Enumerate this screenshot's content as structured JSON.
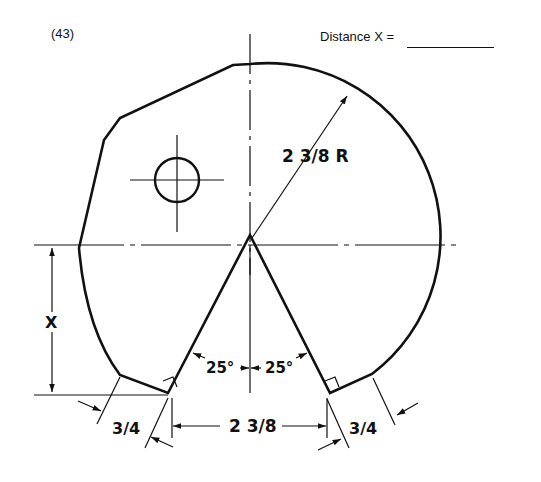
{
  "header": {
    "problem_number": "(43)",
    "answer_prompt": "Distance  X  ="
  },
  "drawing": {
    "radius_label": "2 3/8 R",
    "angle_left_label": "25°",
    "angle_right_label": "25°",
    "width_label": "2 3/8",
    "offset_left_label": "3/4",
    "offset_right_label": "3/4",
    "unknown_label": "X"
  },
  "colors": {
    "line": "#111111",
    "background": "#ffffff"
  }
}
